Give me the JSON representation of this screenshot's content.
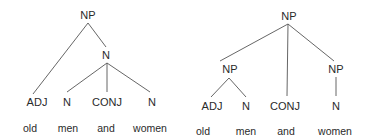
{
  "diagram": {
    "type": "syntax-trees",
    "line_color": "#555555",
    "trees": [
      {
        "id": "left",
        "nodes": [
          {
            "id": "np",
            "label": "NP",
            "x": 88,
            "y": 10
          },
          {
            "id": "n",
            "label": "N",
            "x": 106,
            "y": 50
          },
          {
            "id": "adj",
            "label": "ADJ",
            "x": 37,
            "y": 97
          },
          {
            "id": "n1",
            "label": "N",
            "x": 67,
            "y": 97
          },
          {
            "id": "conj",
            "label": "CONJ",
            "x": 107,
            "y": 97
          },
          {
            "id": "n2",
            "label": "N",
            "x": 152,
            "y": 97
          }
        ],
        "words": [
          {
            "label": "old",
            "x": 30,
            "y": 123
          },
          {
            "label": "men",
            "x": 68,
            "y": 123
          },
          {
            "label": "and",
            "x": 106,
            "y": 123
          },
          {
            "label": "women",
            "x": 150,
            "y": 123
          }
        ]
      },
      {
        "id": "right",
        "nodes": [
          {
            "id": "np",
            "label": "NP",
            "x": 289,
            "y": 11
          },
          {
            "id": "np_l",
            "label": "NP",
            "x": 230,
            "y": 64
          },
          {
            "id": "np_r",
            "label": "NP",
            "x": 336,
            "y": 64
          },
          {
            "id": "adj",
            "label": "ADJ",
            "x": 212,
            "y": 101
          },
          {
            "id": "n1",
            "label": "N",
            "x": 246,
            "y": 101
          },
          {
            "id": "conj",
            "label": "CONJ",
            "x": 285,
            "y": 101
          },
          {
            "id": "n2",
            "label": "N",
            "x": 336,
            "y": 101
          }
        ],
        "words": [
          {
            "label": "old",
            "x": 203,
            "y": 126
          },
          {
            "label": "men",
            "x": 246,
            "y": 126
          },
          {
            "label": "and",
            "x": 286,
            "y": 126
          },
          {
            "label": "women",
            "x": 335,
            "y": 126
          }
        ]
      }
    ]
  }
}
